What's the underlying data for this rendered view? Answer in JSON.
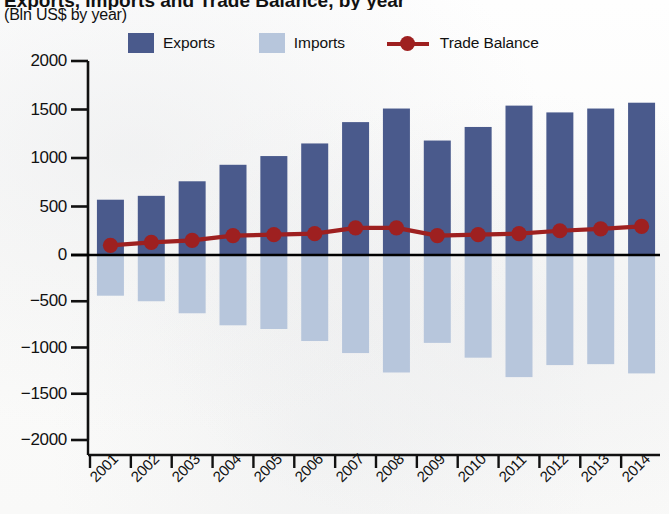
{
  "header": {
    "title": "Exports, Imports and Trade Balance, by year",
    "subtitle": "(Bln US$ by year)"
  },
  "legend": {
    "items": [
      {
        "label": "Exports",
        "marker": "square-swatch",
        "color": "#4a5a8c"
      },
      {
        "label": "Imports",
        "marker": "square-swatch",
        "color": "#b7c6dc"
      },
      {
        "label": "Trade Balance",
        "marker": "line-with-dot",
        "color": "#9e2020"
      }
    ]
  },
  "chart_data": {
    "type": "bar",
    "title": "Exports, Imports and Trade Balance, by year",
    "subtitle": "(Bln US$ by year)",
    "xlabel": "",
    "ylabel": "",
    "ylim": [
      -2000,
      2000
    ],
    "yticks": [
      2000,
      1500,
      1000,
      500,
      0,
      -500,
      -1000,
      -1500,
      -2000
    ],
    "ytick_labels": [
      "2000",
      "1500",
      "1000",
      "500",
      "0",
      "−500",
      "−1000",
      "−1500",
      "−2000"
    ],
    "grid": false,
    "legend_position": "top",
    "categories": [
      "2001",
      "2002",
      "2003",
      "2004",
      "2005",
      "2006",
      "2007",
      "2008",
      "2009",
      "2010",
      "2011",
      "2012",
      "2013",
      "2014"
    ],
    "series": [
      {
        "name": "Exports",
        "type": "bar",
        "color": "#4a5a8c",
        "values": [
          570,
          610,
          760,
          930,
          1020,
          1150,
          1370,
          1510,
          1180,
          1320,
          1540,
          1470,
          1510,
          1570
        ]
      },
      {
        "name": "Imports",
        "type": "bar",
        "color": "#b7c6dc",
        "values": [
          -440,
          -500,
          -630,
          -760,
          -800,
          -930,
          -1060,
          -1270,
          -950,
          -1110,
          -1320,
          -1190,
          -1180,
          -1280
        ]
      },
      {
        "name": "Trade Balance",
        "type": "line",
        "color": "#9e2020",
        "values": [
          100,
          130,
          150,
          200,
          210,
          220,
          280,
          280,
          200,
          210,
          220,
          250,
          270,
          295
        ]
      }
    ]
  }
}
